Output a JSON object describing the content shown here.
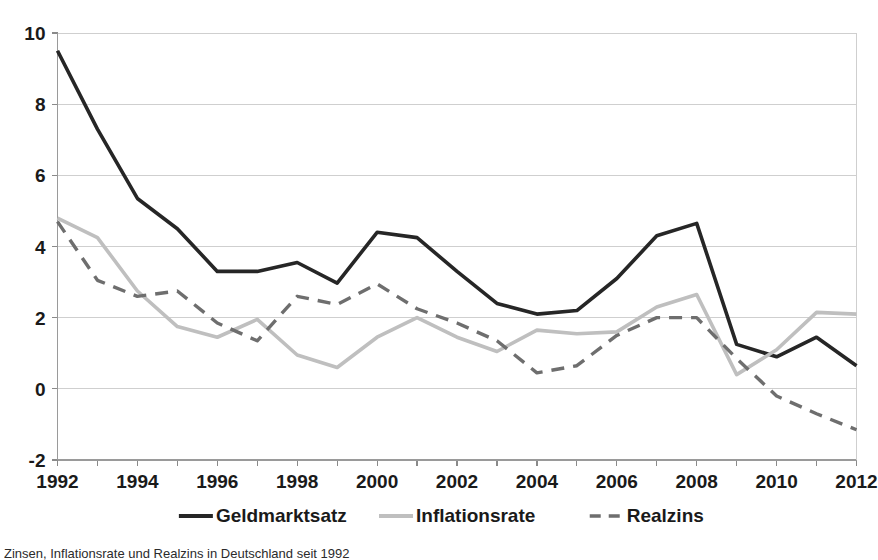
{
  "chart_data": {
    "type": "line",
    "title": "",
    "xlabel": "",
    "ylabel": "",
    "xlim": [
      1992,
      2012
    ],
    "ylim": [
      -2,
      10
    ],
    "y_ticks": [
      -2,
      0,
      2,
      4,
      6,
      8,
      10
    ],
    "y_tick_labels": [
      "-2",
      "0",
      "2",
      "4",
      "6",
      "8",
      "10"
    ],
    "x_ticks": [
      1992,
      1993,
      1994,
      1995,
      1996,
      1997,
      1998,
      1999,
      2000,
      2001,
      2002,
      2003,
      2004,
      2005,
      2006,
      2007,
      2008,
      2009,
      2010,
      2011,
      2012
    ],
    "x_tick_labels": [
      "1992",
      "",
      "1994",
      "",
      "1996",
      "",
      "1998",
      "",
      "2000",
      "",
      "2002",
      "",
      "2004",
      "",
      "2006",
      "",
      "2008",
      "",
      "2010",
      "",
      "2012"
    ],
    "x_labeled_ticks": [
      1992,
      1994,
      1996,
      1998,
      2000,
      2002,
      2004,
      2006,
      2008,
      2010,
      2012
    ],
    "grid": true,
    "grid_axis": "y",
    "legend_position": "bottom",
    "x": [
      1992,
      1993,
      1994,
      1995,
      1996,
      1997,
      1998,
      1999,
      2000,
      2001,
      2002,
      2003,
      2004,
      2005,
      2006,
      2007,
      2008,
      2009,
      2010,
      2011,
      2012
    ],
    "series": [
      {
        "name": "Geldmarktsatz",
        "color": "#262626",
        "style": "solid",
        "width": 3.6,
        "values": [
          9.5,
          7.3,
          5.35,
          4.5,
          3.3,
          3.3,
          3.55,
          2.97,
          4.4,
          4.25,
          3.3,
          2.4,
          2.1,
          2.2,
          3.1,
          4.3,
          4.65,
          1.25,
          0.9,
          1.45,
          0.65
        ]
      },
      {
        "name": "Inflationsrate",
        "color": "#bfbfbf",
        "style": "solid",
        "width": 3.6,
        "values": [
          4.8,
          4.25,
          2.75,
          1.75,
          1.45,
          1.95,
          0.95,
          0.6,
          1.45,
          2.0,
          1.45,
          1.05,
          1.65,
          1.55,
          1.6,
          2.3,
          2.65,
          0.4,
          1.1,
          2.15,
          2.1
        ]
      },
      {
        "name": "Realzins",
        "color": "#6e6e6e",
        "style": "dashed",
        "width": 3.4,
        "values": [
          4.7,
          3.05,
          2.6,
          2.75,
          1.85,
          1.35,
          2.6,
          2.37,
          2.95,
          2.25,
          1.85,
          1.35,
          0.45,
          0.65,
          1.5,
          2.0,
          2.0,
          0.85,
          -0.2,
          -0.7,
          -1.15
        ]
      }
    ]
  },
  "legend": {
    "items": [
      {
        "label": "Geldmarktsatz",
        "color": "#262626",
        "style": "solid"
      },
      {
        "label": "Inflationsrate",
        "color": "#bfbfbf",
        "style": "solid"
      },
      {
        "label": "Realzins",
        "color": "#6e6e6e",
        "style": "dashed"
      }
    ]
  },
  "caption": {
    "text": "Zinsen, Inflationsrate und Realzins in Deutschland seit 1992"
  }
}
